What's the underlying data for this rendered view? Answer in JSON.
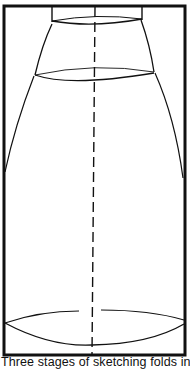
{
  "figure": {
    "frame": {
      "x": 4,
      "y": 6,
      "width": 182,
      "height": 350
    },
    "colors": {
      "stroke": "#111111",
      "background": "#ffffff"
    }
  },
  "caption": {
    "text": "Three stages of sketching folds in"
  }
}
